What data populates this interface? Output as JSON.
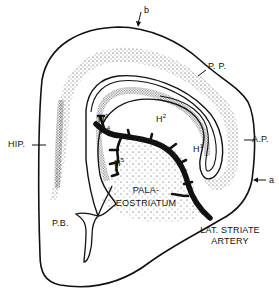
{
  "figure": {
    "type": "anatomical line drawing (coronal brain section)",
    "colors": {
      "ink": "#111111",
      "background": "#ffffff",
      "stipple": "#222222"
    }
  },
  "labels": {
    "b": "b",
    "pp": "P. P.",
    "ap": "A.P.",
    "a": "a",
    "hip": "HIP.",
    "pb": "P.B.",
    "h3": "H",
    "h3_sup": "3",
    "h4": "H",
    "h4_sup": "4",
    "h2": "H",
    "h2_sup": "2",
    "h1": "H",
    "h1_sup": "1",
    "h5": "H",
    "h5_sup": "5",
    "palaeo_line1": "PALA-",
    "palaeo_line2": "EOSTRIATUM",
    "artery_line1": "LAT. STRIATE",
    "artery_line2": "ARTERY"
  }
}
